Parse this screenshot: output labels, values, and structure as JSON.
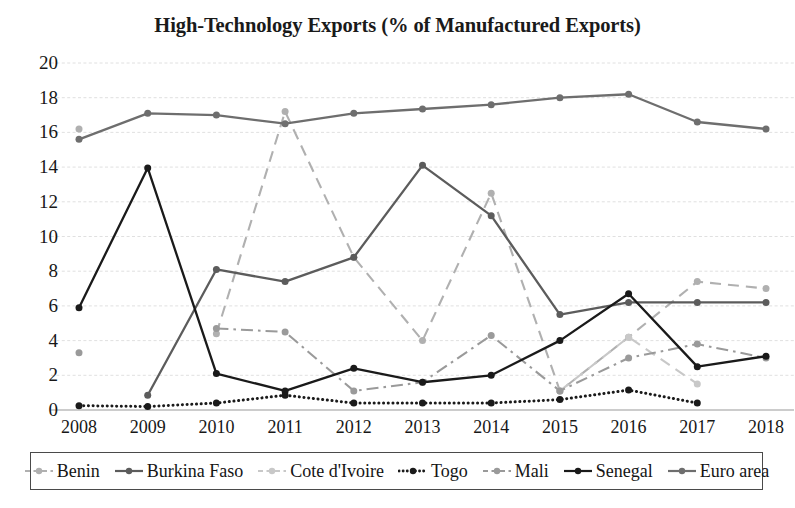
{
  "chart": {
    "title": "High-Technology Exports (% of Manufactured Exports)"
  },
  "chart_data": {
    "type": "line",
    "title": "High-Technology Exports (% of Manufactured Exports)",
    "xlabel": "",
    "ylabel": "",
    "x": [
      "2008",
      "2009",
      "2010",
      "2011",
      "2012",
      "2013",
      "2014",
      "2015",
      "2016",
      "2017",
      "2018"
    ],
    "ylim": [
      0,
      20
    ],
    "ytick_values": [
      0,
      2,
      4,
      6,
      8,
      10,
      12,
      14,
      16,
      18,
      20
    ],
    "ytick_labels": [
      "0",
      "2",
      "4",
      "6",
      "8",
      "10",
      "12",
      "14",
      "16",
      "18",
      "20"
    ],
    "grid": true,
    "legend_position": "bottom",
    "series": [
      {
        "name": "Benin",
        "color": "#b0b0b0",
        "style": "dashed",
        "marker": "circle",
        "values": [
          16.2,
          null,
          4.4,
          17.2,
          8.8,
          4.0,
          12.5,
          1.1,
          4.2,
          7.4,
          7.0
        ]
      },
      {
        "name": "Burkina Faso",
        "color": "#5c5c5c",
        "style": "solid",
        "marker": "circle",
        "values": [
          null,
          0.85,
          8.1,
          7.4,
          8.8,
          14.1,
          11.2,
          5.5,
          6.2,
          6.2,
          6.2
        ]
      },
      {
        "name": "Cote d'Ivoire",
        "color": "#c8c8c8",
        "style": "dashed",
        "marker": "circle",
        "values": [
          null,
          null,
          null,
          null,
          null,
          null,
          null,
          1.1,
          4.2,
          1.5,
          null
        ]
      },
      {
        "name": "Togo",
        "color": "#1a1a1a",
        "style": "dotted",
        "marker": "circle",
        "values": [
          0.25,
          0.2,
          0.4,
          0.85,
          0.4,
          0.4,
          0.4,
          0.6,
          1.15,
          0.4,
          null
        ]
      },
      {
        "name": "Mali",
        "color": "#9a9a9a",
        "style": "dashdot",
        "marker": "circle",
        "values": [
          3.3,
          null,
          4.7,
          4.5,
          1.1,
          1.6,
          4.3,
          1.1,
          3.0,
          3.8,
          3.0
        ]
      },
      {
        "name": "Senegal",
        "color": "#1a1a1a",
        "style": "solid",
        "marker": "circle",
        "values": [
          5.9,
          13.95,
          2.1,
          1.1,
          2.4,
          1.6,
          2.0,
          4.0,
          6.7,
          2.5,
          3.1
        ]
      },
      {
        "name": "Euro area",
        "color": "#6e6e6e",
        "style": "solid",
        "marker": "circle",
        "values": [
          15.6,
          17.1,
          17.0,
          16.5,
          17.1,
          17.35,
          17.6,
          18.0,
          18.2,
          16.6,
          16.2
        ]
      }
    ]
  },
  "legend": {
    "items": [
      {
        "label": "Benin"
      },
      {
        "label": "Burkina Faso"
      },
      {
        "label": "Cote d'Ivoire"
      },
      {
        "label": "Togo"
      },
      {
        "label": "Mali"
      },
      {
        "label": "Senegal"
      },
      {
        "label": "Euro area"
      }
    ]
  }
}
